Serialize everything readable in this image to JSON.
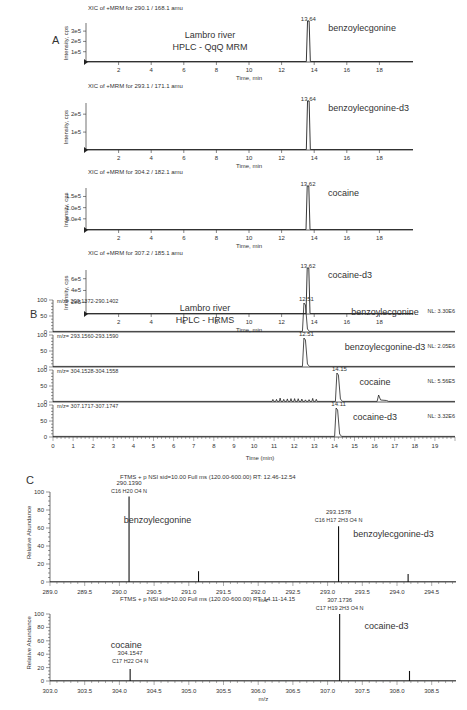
{
  "panels": {
    "A": {
      "letter": "A",
      "title_line1": "Lambro river",
      "title_line2": "HPLC - QqQ MRM",
      "xlabel": "Time, min",
      "ylabel": "Intensity, cps"
    },
    "B": {
      "letter": "B",
      "title_line1": "Lambro river",
      "title_line2": "HPLC - HRMS",
      "xlabel": "Time (min)"
    },
    "C": {
      "letter": "C",
      "ylabel": "Relative Abundance",
      "xlabel": "m/z",
      "header1": "FTMS + p NSI sid=10.00 Full ms (120.00-600.00) RT: 12.46-12.54",
      "header2": "FTMS + p NSI sid=10.00 Full ms (120.00-600.00) RT: 14.11-14.15"
    }
  },
  "chart_data": [
    {
      "panel": "A",
      "type": "line",
      "xlabel": "Time, min",
      "ylabel": "Intensity, cps",
      "xticks": [
        2,
        4,
        6,
        8,
        10,
        12,
        14,
        16,
        18
      ],
      "xlim": [
        0,
        20
      ],
      "traces": [
        {
          "header": "XIC of +MRM for 290.1 / 168.1 amu",
          "compound": "benzoylecgonine",
          "rt_label": "13.64",
          "rt": 13.64,
          "yticks": [
            "1e5",
            "2e5",
            "3e5"
          ],
          "peak": 370000.0
        },
        {
          "header": "XIC of +MRM for 293.1 / 171.1 amu",
          "compound": "benzoylecgonine-d3",
          "rt_label": "13.64",
          "rt": 13.64,
          "yticks": [
            "1e5",
            "2e5"
          ],
          "peak": 260000.0
        },
        {
          "header": "XIC of +MRM for 304.2 / 182.1 amu",
          "compound": "cocaine",
          "rt_label": "13.62",
          "rt": 13.62,
          "yticks": [
            "5.0e4",
            "1.0e5",
            "1.5e5"
          ],
          "peak": 190000.0
        },
        {
          "header": "XIC of +MRM for 307.2 / 185.1 amu",
          "compound": "cocaine-d3",
          "rt_label": "13.62",
          "rt": 13.62,
          "yticks": [
            "2e5",
            "4e5",
            "6e5"
          ],
          "peak": 700000.0
        }
      ]
    },
    {
      "panel": "B",
      "type": "line",
      "xlabel": "Time (min)",
      "ylabel": "",
      "xticks": [
        0,
        1,
        2,
        3,
        4,
        5,
        6,
        7,
        8,
        9,
        10,
        11,
        12,
        13,
        14,
        15,
        16,
        17,
        18,
        19
      ],
      "xlim": [
        0,
        20
      ],
      "yticks": [
        0,
        50,
        100
      ],
      "traces": [
        {
          "header": "m/z= 290.1372-290.1402",
          "compound": "benzoylecgonine",
          "rt_label": "12.51",
          "rt": 12.51,
          "nl": "NL: 3.30E6"
        },
        {
          "header": "m/z= 293.1560-293.1590",
          "compound": "benzoylecgonine-d3",
          "rt_label": "12.51",
          "rt": 12.51,
          "nl": "NL: 2.05E6"
        },
        {
          "header": "m/z= 304.1528-304.1558",
          "compound": "cocaine",
          "rt_label": "14.15",
          "rt": 14.15,
          "nl": "NL: 5.56E5"
        },
        {
          "header": "m/z= 307.1717-307.1747",
          "compound": "cocaine-d3",
          "rt_label": "14.11",
          "rt": 14.11,
          "nl": "NL: 3.32E6"
        }
      ]
    },
    {
      "panel": "C1",
      "type": "bar",
      "title": "FTMS + p NSI sid=10.00 Full ms (120.00-600.00) RT: 12.46-12.54",
      "xlabel": "m/z",
      "ylabel": "Relative Abundance",
      "xticks": [
        "289.0",
        "289.5",
        "290.0",
        "290.5",
        "291.0",
        "291.5",
        "292.0",
        "292.5",
        "293.0",
        "293.5",
        "294.0",
        "294.5"
      ],
      "yticks": [
        0,
        20,
        40,
        60,
        80,
        100
      ],
      "xlim": [
        289.0,
        294.85
      ],
      "peaks": [
        {
          "mz": 290.139,
          "rel": 95,
          "label": "290.1390",
          "formula": "C16 H20 O4 N",
          "compound": "benzoylecgonine"
        },
        {
          "mz": 291.14,
          "rel": 12
        },
        {
          "mz": 293.1578,
          "rel": 62,
          "label": "293.1578",
          "formula": "C16 H17 2H3 O4 N",
          "compound": "benzoylecgonine-d3"
        },
        {
          "mz": 294.16,
          "rel": 9
        }
      ]
    },
    {
      "panel": "C2",
      "type": "bar",
      "title": "FTMS + p NSI sid=10.00 Full ms (120.00-600.00) RT: 14.11-14.15",
      "xlabel": "m/z",
      "ylabel": "Relative Abundance",
      "xticks": [
        "303.0",
        "303.5",
        "304.0",
        "304.5",
        "305.0",
        "305.5",
        "306.0",
        "306.5",
        "307.0",
        "307.5",
        "308.0",
        "308.5"
      ],
      "yticks": [
        0,
        20,
        40,
        60,
        80,
        100
      ],
      "xlim": [
        303.0,
        308.85
      ],
      "peaks": [
        {
          "mz": 304.1547,
          "rel": 18,
          "label": "304.1547",
          "formula": "C17 H22 O4 N",
          "compound": "cocaine"
        },
        {
          "mz": 307.1736,
          "rel": 100,
          "label": "307.1736",
          "formula": "C17 H19 2H3 O4 N",
          "compound": "cocaine-d3"
        },
        {
          "mz": 308.18,
          "rel": 15
        }
      ]
    }
  ]
}
